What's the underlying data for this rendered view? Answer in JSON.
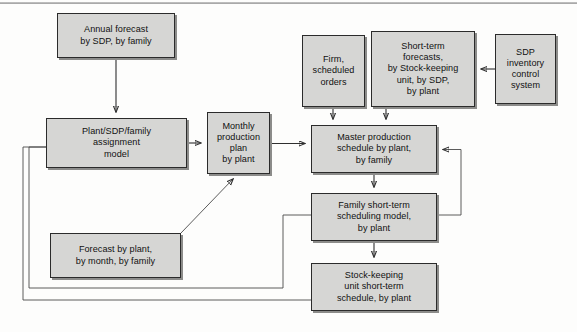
{
  "diagram": {
    "background_color": "#fdfdfc",
    "node_fill_color": "#d6d6d4",
    "node_border_color": "#2b2b2b",
    "arrow_color": "#2f2f2f",
    "nodes": [
      {
        "id": "annual-forecast",
        "label": "Annual forecast\nby SDP, by family",
        "x": 57,
        "y": 13,
        "w": 118,
        "h": 45
      },
      {
        "id": "plant-sdp-family-assignment-model",
        "label": "Plant/SDP/family\nassignment\nmodel",
        "x": 46,
        "y": 118,
        "w": 141,
        "h": 50
      },
      {
        "id": "monthly-production-plan",
        "label": "Monthly\nproduction\nplan\nby plant",
        "x": 207,
        "y": 112,
        "w": 63,
        "h": 62
      },
      {
        "id": "firm-scheduled-orders",
        "label": "Firm,\nscheduled\norders",
        "x": 302,
        "y": 35,
        "w": 63,
        "h": 72
      },
      {
        "id": "short-term-forecasts",
        "label": "Short-term\nforecasts,\nby Stock-keeping\nunit, by SDP,\nby plant",
        "x": 371,
        "y": 31,
        "w": 104,
        "h": 76
      },
      {
        "id": "sdp-inventory-control-system",
        "label": "SDP\ninventory\ncontrol\nsystem",
        "x": 495,
        "y": 34,
        "w": 61,
        "h": 70
      },
      {
        "id": "master-production-schedule",
        "label": "Master production\nschedule by plant,\nby family",
        "x": 311,
        "y": 125,
        "w": 126,
        "h": 48
      },
      {
        "id": "family-short-term-scheduling-model",
        "label": "Family short-term\nscheduling model,\nby plant",
        "x": 311,
        "y": 193,
        "w": 126,
        "h": 48
      },
      {
        "id": "stock-keeping-unit-short-term-schedule",
        "label": "Stock-keeping\nunit short-term\nschedule, by plant",
        "x": 311,
        "y": 263,
        "w": 126,
        "h": 48
      },
      {
        "id": "forecast-by-plant",
        "label": "Forecast by plant,\nby month, by family",
        "x": 50,
        "y": 233,
        "w": 131,
        "h": 45
      }
    ],
    "connections": [
      {
        "id": "annual-forecast-to-assignment-model",
        "from": "annual-forecast",
        "to": "plant-sdp-family-assignment-model",
        "kind": "arrow-down"
      },
      {
        "id": "assignment-model-to-monthly-plan",
        "from": "plant-sdp-family-assignment-model",
        "to": "monthly-production-plan",
        "kind": "arrow-right"
      },
      {
        "id": "monthly-plan-to-master-schedule",
        "from": "monthly-production-plan",
        "to": "master-production-schedule",
        "kind": "arrow-right"
      },
      {
        "id": "firm-orders-to-master-schedule",
        "from": "firm-scheduled-orders",
        "to": "master-production-schedule",
        "kind": "arrow-down"
      },
      {
        "id": "short-term-forecasts-to-master-schedule",
        "from": "short-term-forecasts",
        "to": "master-production-schedule",
        "kind": "arrow-down"
      },
      {
        "id": "sdp-inventory-to-short-term-forecasts",
        "from": "sdp-inventory-control-system",
        "to": "short-term-forecasts",
        "kind": "arrow-left"
      },
      {
        "id": "master-schedule-to-family-model",
        "from": "master-production-schedule",
        "to": "family-short-term-scheduling-model",
        "kind": "arrow-down"
      },
      {
        "id": "family-model-to-sku-schedule",
        "from": "family-short-term-scheduling-model",
        "to": "stock-keeping-unit-short-term-schedule",
        "kind": "arrow-down"
      },
      {
        "id": "forecast-by-plant-to-monthly-plan",
        "from": "forecast-by-plant",
        "to": "monthly-production-plan",
        "kind": "arrow-diagonal"
      },
      {
        "id": "family-model-feedback-to-master-schedule",
        "from": "family-short-term-scheduling-model",
        "to": "master-production-schedule",
        "kind": "feedback-right"
      },
      {
        "id": "family-model-feedback-to-assignment-model",
        "from": "family-short-term-scheduling-model",
        "to": "plant-sdp-family-assignment-model",
        "kind": "feedback-left-inner"
      },
      {
        "id": "sku-schedule-feedback-to-assignment-model",
        "from": "stock-keeping-unit-short-term-schedule",
        "to": "plant-sdp-family-assignment-model",
        "kind": "feedback-left-outer"
      }
    ]
  }
}
